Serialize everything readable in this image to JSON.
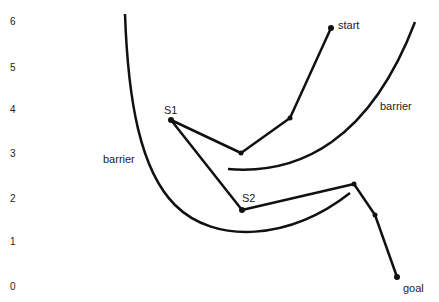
{
  "y_axis": {
    "ticks": [
      {
        "label": "6",
        "y": 24
      },
      {
        "label": "5",
        "y": 68
      },
      {
        "label": "4",
        "y": 110
      },
      {
        "label": "3",
        "y": 155
      },
      {
        "label": "2",
        "y": 199
      },
      {
        "label": "1",
        "y": 242
      },
      {
        "label": "0",
        "y": 288
      }
    ]
  },
  "labels": {
    "start": "start",
    "goal": "goal",
    "s1": "S1",
    "s2": "S2",
    "barrier_left": "barrier",
    "barrier_right": "barrier"
  },
  "path": {
    "points": [
      [
        331,
        28
      ],
      [
        290,
        118
      ],
      [
        241,
        153
      ],
      [
        171,
        120
      ],
      [
        242,
        210
      ],
      [
        354,
        184
      ],
      [
        375,
        215
      ],
      [
        397,
        277
      ]
    ]
  }
}
